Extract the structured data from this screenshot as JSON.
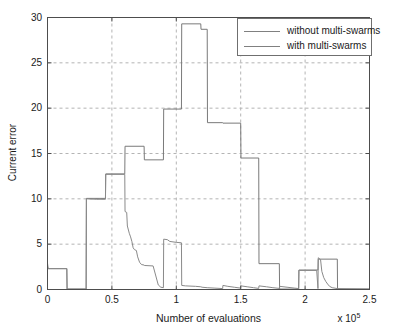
{
  "chart_data": {
    "type": "line",
    "title": "",
    "xlabel": "Number of evaluations",
    "ylabel": "Current error",
    "x_multiplier": "x 10",
    "x_multiplier_exp": "5",
    "xlim": [
      0,
      2.5
    ],
    "ylim": [
      0,
      30
    ],
    "xticks": [
      "0",
      "0.5",
      "1",
      "1.5",
      "2",
      "2.5"
    ],
    "xtick_values": [
      0,
      0.5,
      1,
      1.5,
      2,
      2.5
    ],
    "yticks": [
      "0",
      "5",
      "10",
      "15",
      "20",
      "25",
      "30"
    ],
    "ytick_values": [
      0,
      5,
      10,
      15,
      20,
      25,
      30
    ],
    "grid": true,
    "grid_style": "dashed",
    "legend_position": "top-right",
    "series": [
      {
        "name": "without multi-swarms",
        "color": "#7a7a7a",
        "points": [
          [
            0.0,
            2.9
          ],
          [
            0.005,
            2.3
          ],
          [
            0.02,
            2.3
          ],
          [
            0.15,
            2.3
          ],
          [
            0.152,
            0.05
          ],
          [
            0.3,
            0.05
          ],
          [
            0.302,
            10.05
          ],
          [
            0.45,
            10.05
          ],
          [
            0.452,
            12.75
          ],
          [
            0.6,
            12.75
          ],
          [
            0.602,
            15.8
          ],
          [
            0.75,
            15.8
          ],
          [
            0.752,
            14.3
          ],
          [
            0.9,
            14.3
          ],
          [
            0.902,
            19.9
          ],
          [
            1.04,
            19.9
          ],
          [
            1.042,
            29.3
          ],
          [
            1.19,
            29.3
          ],
          [
            1.192,
            28.7
          ],
          [
            1.24,
            28.7
          ],
          [
            1.242,
            18.4
          ],
          [
            1.36,
            18.4
          ],
          [
            1.362,
            18.35
          ],
          [
            1.5,
            18.35
          ],
          [
            1.502,
            14.5
          ],
          [
            1.64,
            14.5
          ],
          [
            1.642,
            2.85
          ],
          [
            1.8,
            2.85
          ],
          [
            1.802,
            0.05
          ],
          [
            1.95,
            0.05
          ],
          [
            1.952,
            2.15
          ],
          [
            2.1,
            2.15
          ],
          [
            2.102,
            3.35
          ],
          [
            2.25,
            3.35
          ],
          [
            2.252,
            0.05
          ],
          [
            2.5,
            0.05
          ]
        ]
      },
      {
        "name": "with multi-swarms",
        "color": "#8a8a8a",
        "points": [
          [
            0.0,
            2.55
          ],
          [
            0.004,
            2.3
          ],
          [
            0.15,
            2.3
          ],
          [
            0.152,
            0.05
          ],
          [
            0.3,
            0.05
          ],
          [
            0.302,
            10.0
          ],
          [
            0.38,
            9.95
          ],
          [
            0.45,
            9.95
          ],
          [
            0.452,
            12.7
          ],
          [
            0.6,
            12.7
          ],
          [
            0.602,
            8.6
          ],
          [
            0.615,
            8.5
          ],
          [
            0.62,
            7.0
          ],
          [
            0.635,
            6.2
          ],
          [
            0.645,
            5.8
          ],
          [
            0.655,
            5.3
          ],
          [
            0.665,
            4.6
          ],
          [
            0.675,
            4.4
          ],
          [
            0.69,
            4.3
          ],
          [
            0.7,
            3.6
          ],
          [
            0.715,
            3.0
          ],
          [
            0.73,
            2.75
          ],
          [
            0.75,
            2.7
          ],
          [
            0.752,
            2.65
          ],
          [
            0.82,
            2.6
          ],
          [
            0.86,
            0.5
          ],
          [
            0.88,
            0.25
          ],
          [
            0.9,
            0.2
          ],
          [
            0.902,
            5.55
          ],
          [
            0.93,
            5.5
          ],
          [
            0.95,
            5.3
          ],
          [
            1.0,
            5.2
          ],
          [
            1.04,
            5.15
          ],
          [
            1.042,
            0.45
          ],
          [
            1.07,
            0.4
          ],
          [
            1.15,
            0.35
          ],
          [
            1.19,
            0.3
          ],
          [
            1.2,
            0.25
          ],
          [
            1.24,
            0.2
          ],
          [
            1.3,
            0.15
          ],
          [
            1.36,
            0.1
          ],
          [
            1.362,
            0.45
          ],
          [
            1.4,
            0.35
          ],
          [
            1.45,
            0.25
          ],
          [
            1.5,
            0.15
          ],
          [
            1.502,
            0.4
          ],
          [
            1.55,
            0.3
          ],
          [
            1.6,
            0.2
          ],
          [
            1.64,
            0.12
          ],
          [
            1.642,
            0.4
          ],
          [
            1.7,
            0.3
          ],
          [
            1.75,
            0.2
          ],
          [
            1.8,
            0.12
          ],
          [
            1.802,
            0.35
          ],
          [
            1.86,
            0.25
          ],
          [
            1.92,
            0.15
          ],
          [
            1.95,
            0.1
          ],
          [
            1.952,
            2.1
          ],
          [
            2.0,
            2.1
          ],
          [
            2.09,
            2.1
          ],
          [
            2.1,
            0.1
          ],
          [
            2.102,
            3.5
          ],
          [
            2.12,
            3.3
          ],
          [
            2.13,
            2.0
          ],
          [
            2.145,
            1.3
          ],
          [
            2.16,
            0.9
          ],
          [
            2.175,
            0.6
          ],
          [
            2.19,
            0.35
          ],
          [
            2.21,
            0.2
          ],
          [
            2.25,
            0.1
          ],
          [
            2.5,
            0.05
          ]
        ]
      }
    ]
  },
  "legend": {
    "items": [
      {
        "label": "without multi-swarms"
      },
      {
        "label": "with multi-swarms"
      }
    ]
  }
}
